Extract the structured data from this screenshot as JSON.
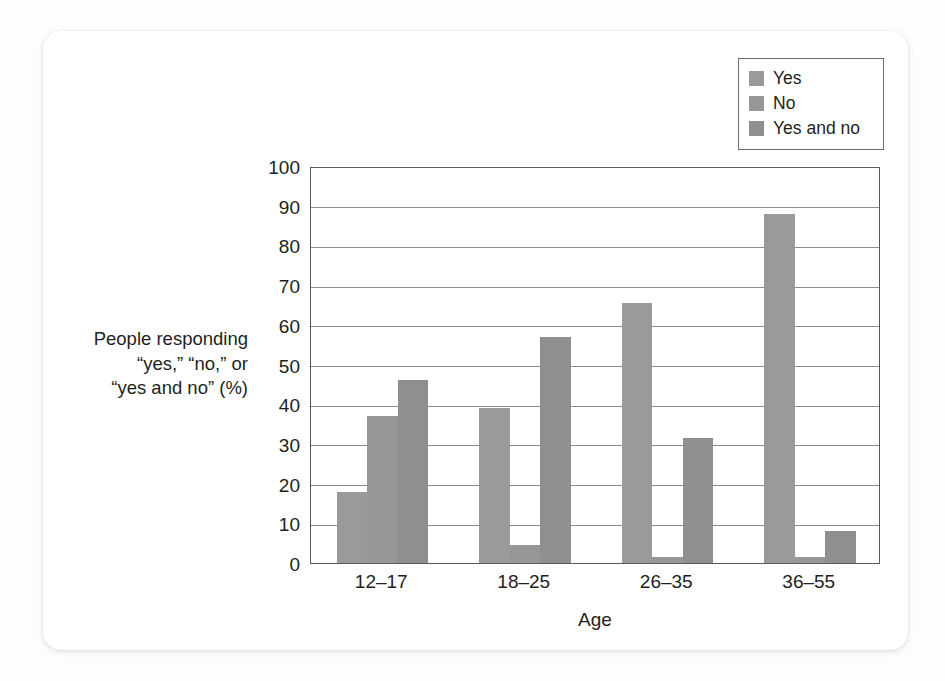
{
  "chart_data": {
    "type": "bar",
    "title": "",
    "xlabel": "Age",
    "ylabel": "People responding “yes,” “no,” or “yes and no” (%)",
    "ylabel_lines": [
      "People responding",
      "“yes,” “no,” or",
      "“yes and no” (%)"
    ],
    "categories": [
      "12–17",
      "18–25",
      "26–35",
      "36–55"
    ],
    "series": [
      {
        "name": "Yes",
        "color": "#9a9a9a",
        "values": [
          18,
          39,
          65.5,
          88
        ]
      },
      {
        "name": "No",
        "color": "#979797",
        "values": [
          37,
          4.5,
          1.5,
          1.5
        ]
      },
      {
        "name": "Yes and no",
        "color": "#8f8f8f",
        "values": [
          46,
          57,
          31.5,
          8
        ]
      }
    ],
    "ylim": [
      0,
      100
    ],
    "y_ticks": [
      0,
      10,
      20,
      30,
      40,
      50,
      60,
      70,
      80,
      90,
      100
    ],
    "y_tick_labels": [
      "0",
      "10",
      "20",
      "30",
      "40",
      "50",
      "60",
      "70",
      "80",
      "90",
      "100"
    ],
    "grid": true,
    "grid_axis": "y",
    "legend_position": "top-right",
    "legend_entries": [
      "Yes",
      "No",
      "Yes and no"
    ]
  },
  "colors": {
    "axis": "#595959",
    "gridline": "#8c8c8c",
    "text": "#231f20",
    "legend_border": "#6e6e6e",
    "card_background": "#ffffff",
    "page_background": "#fdfdfd"
  }
}
